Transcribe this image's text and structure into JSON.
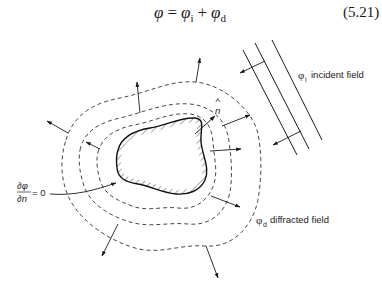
{
  "equation": {
    "lhs": "φ",
    "equals": "=",
    "term1_symbol": "φ",
    "term1_sub": "i",
    "plus": "+",
    "term2_symbol": "φ",
    "term2_sub": "d",
    "number": "(5.21)"
  },
  "labels": {
    "incident_symbol": "φ",
    "incident_sub": "i",
    "incident_text": "incident field",
    "diffracted_symbol": "φ",
    "diffracted_sub": "d",
    "diffracted_text": "diffracted field",
    "normal_symbol": "n",
    "normal_hat": "^",
    "boundary_numerator": "∂φ",
    "boundary_denominator": "∂n",
    "boundary_rhs": "= 0"
  },
  "colors": {
    "ink": "#1a1a1a",
    "background": "#ffffff"
  }
}
